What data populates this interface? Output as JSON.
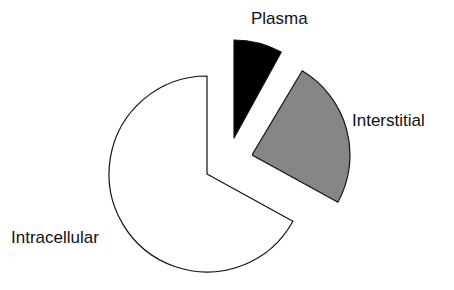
{
  "chart_data": {
    "type": "pie",
    "title": "",
    "categories": [
      "Intracellular",
      "Interstitial",
      "Plasma"
    ],
    "values": [
      67,
      25,
      8
    ],
    "unit": "% of body water (approx.)",
    "colors": {
      "Intracellular": "#ffffff",
      "Interstitial": "#8a8a8a",
      "Plasma": "#000000"
    },
    "exploded": true,
    "legend": "none (direct slice labels)"
  },
  "labels": {
    "plasma": "Plasma",
    "interstitial": "Interstitial",
    "intracellular": "Intracellular"
  }
}
